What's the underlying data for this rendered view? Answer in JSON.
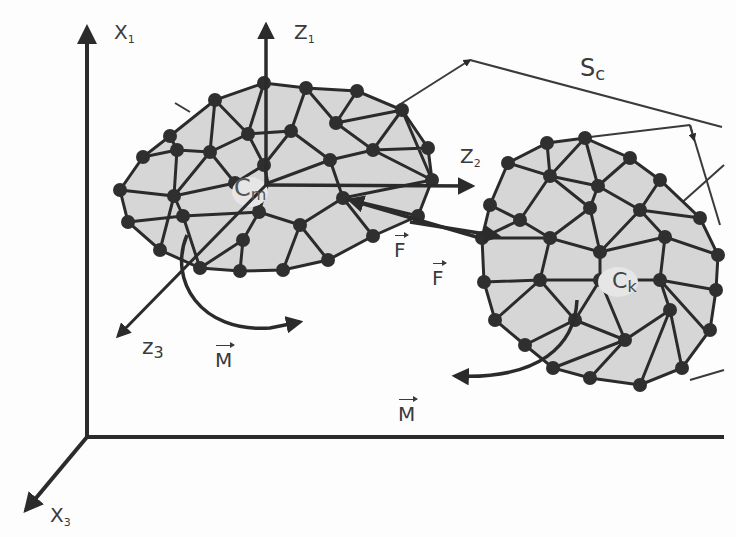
{
  "diagram": {
    "colors": {
      "line": "#2b2b2b",
      "mesh_fill": "#d6d6d6",
      "node": "#2f2f2f",
      "background": "#fdfdfd",
      "text": "#3a3a3a"
    },
    "labels": {
      "x1": {
        "base": "X",
        "sub": "1"
      },
      "x3": {
        "base": "X",
        "sub": "3"
      },
      "z1": {
        "base": "Z",
        "sub": "1"
      },
      "z2": {
        "base": "Z",
        "sub": "2"
      },
      "z3": {
        "base": "z",
        "sub": "3"
      },
      "sc": {
        "base": "S",
        "sub": "c"
      },
      "cm": {
        "base": "C",
        "sub": "m"
      },
      "ck": {
        "base": "C",
        "sub": "k"
      },
      "f1": "F",
      "f2": "F",
      "m1": "M",
      "m2": "M"
    },
    "bodies": [
      {
        "name": "body-m",
        "center_label": "Cm",
        "center": [
          268,
          183
        ]
      },
      {
        "name": "body-k",
        "center_label": "Ck",
        "center": [
          600,
          270
        ]
      }
    ]
  }
}
